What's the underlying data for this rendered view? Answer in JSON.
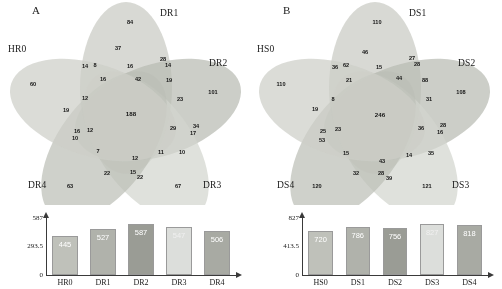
{
  "figure": {
    "panels": [
      {
        "id": "A",
        "letter": "A",
        "set_labels": [
          "HR0",
          "DR1",
          "DR2",
          "DR3",
          "DR4"
        ],
        "venn_counts": {
          "HR0_only": 60,
          "DR1_only": 84,
          "DR2_only": 101,
          "DR3_only": 67,
          "DR4_only": 63,
          "core": 188,
          "regions": [
            {
              "label": 37,
              "x": 118,
              "y": 48
            },
            {
              "label": 14,
              "x": 85,
              "y": 66
            },
            {
              "label": 8,
              "x": 95,
              "y": 65
            },
            {
              "label": 16,
              "x": 130,
              "y": 66
            },
            {
              "label": 28,
              "x": 163,
              "y": 59
            },
            {
              "label": 14,
              "x": 168,
              "y": 65
            },
            {
              "label": 16,
              "x": 103,
              "y": 79
            },
            {
              "label": 42,
              "x": 138,
              "y": 79
            },
            {
              "label": 19,
              "x": 169,
              "y": 80
            },
            {
              "label": 12,
              "x": 85,
              "y": 98
            },
            {
              "label": 23,
              "x": 180,
              "y": 99
            },
            {
              "label": 19,
              "x": 66,
              "y": 110
            },
            {
              "label": 188,
              "x": 131,
              "y": 113
            },
            {
              "label": 16,
              "x": 77,
              "y": 131
            },
            {
              "label": 12,
              "x": 90,
              "y": 130
            },
            {
              "label": 10,
              "x": 75,
              "y": 138
            },
            {
              "label": 29,
              "x": 173,
              "y": 128
            },
            {
              "label": 34,
              "x": 196,
              "y": 126
            },
            {
              "label": 17,
              "x": 193,
              "y": 133
            },
            {
              "label": 7,
              "x": 98,
              "y": 151
            },
            {
              "label": 12,
              "x": 135,
              "y": 158
            },
            {
              "label": 11,
              "x": 161,
              "y": 152
            },
            {
              "label": 10,
              "x": 182,
              "y": 152
            },
            {
              "label": 22,
              "x": 107,
              "y": 173
            },
            {
              "label": 15,
              "x": 133,
              "y": 172
            },
            {
              "label": 22,
              "x": 140,
              "y": 177
            }
          ]
        },
        "bar_chart": {
          "type": "bar",
          "categories": [
            "HR0",
            "DR1",
            "DR2",
            "DR3",
            "DR4"
          ],
          "values": [
            445,
            527,
            587,
            547,
            506
          ],
          "yticks": [
            "0",
            "293.5",
            "587"
          ],
          "ylim": [
            0,
            587
          ],
          "ylabel": "",
          "xlabel": "",
          "title": ""
        }
      },
      {
        "id": "B",
        "letter": "B",
        "set_labels": [
          "HS0",
          "DS1",
          "DS2",
          "DS3",
          "DS4"
        ],
        "venn_counts": {
          "HS0_only": 110,
          "DS1_only": 110,
          "DS2_only": 108,
          "DS3_only": 121,
          "DS4_only": 120,
          "core": 246,
          "regions": [
            {
              "label": 46,
              "x": 114,
              "y": 52
            },
            {
              "label": 36,
              "x": 84,
              "y": 67
            },
            {
              "label": 62,
              "x": 95,
              "y": 65
            },
            {
              "label": 15,
              "x": 128,
              "y": 67
            },
            {
              "label": 27,
              "x": 161,
              "y": 58
            },
            {
              "label": 28,
              "x": 166,
              "y": 64
            },
            {
              "label": 21,
              "x": 98,
              "y": 80
            },
            {
              "label": 44,
              "x": 148,
              "y": 78
            },
            {
              "label": 88,
              "x": 174,
              "y": 80
            },
            {
              "label": 8,
              "x": 82,
              "y": 99
            },
            {
              "label": 31,
              "x": 178,
              "y": 99
            },
            {
              "label": 19,
              "x": 64,
              "y": 109
            },
            {
              "label": 246,
              "x": 129,
              "y": 114
            },
            {
              "label": 25,
              "x": 72,
              "y": 131
            },
            {
              "label": 23,
              "x": 87,
              "y": 129
            },
            {
              "label": 53,
              "x": 71,
              "y": 140
            },
            {
              "label": 36,
              "x": 170,
              "y": 128
            },
            {
              "label": 28,
              "x": 192,
              "y": 125
            },
            {
              "label": 16,
              "x": 189,
              "y": 132
            },
            {
              "label": 15,
              "x": 95,
              "y": 153
            },
            {
              "label": 43,
              "x": 131,
              "y": 161
            },
            {
              "label": 14,
              "x": 158,
              "y": 155
            },
            {
              "label": 35,
              "x": 180,
              "y": 153
            },
            {
              "label": 32,
              "x": 105,
              "y": 173
            },
            {
              "label": 28,
              "x": 130,
              "y": 173
            },
            {
              "label": 39,
              "x": 138,
              "y": 178
            }
          ]
        },
        "bar_chart": {
          "type": "bar",
          "categories": [
            "HS0",
            "DS1",
            "DS2",
            "DS3",
            "DS4"
          ],
          "values": [
            720,
            786,
            756,
            827,
            818
          ],
          "yticks": [
            "0",
            "413.5",
            "827"
          ],
          "ylim": [
            0,
            827
          ],
          "ylabel": "",
          "xlabel": "",
          "title": ""
        }
      }
    ],
    "colors": {
      "ellipse_1": "#c9cbc4",
      "ellipse_2": "#b3b5ad",
      "ellipse_3": "#9b9d95",
      "ellipse_4": "#d5d7d0",
      "ellipse_5": "#c2c4bd",
      "bar_1": "#bfc1ba",
      "bar_2": "#b0b2ab",
      "bar_3": "#9a9c95",
      "bar_4": "#dcdedb",
      "bar_5": "#a8aaa3",
      "axis": "#3a3a3a",
      "text": "#1a1a1a"
    }
  }
}
